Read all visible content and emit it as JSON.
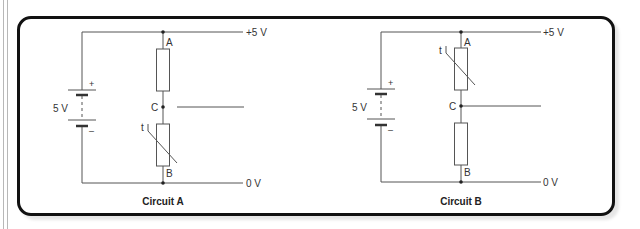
{
  "figure": {
    "colors": {
      "wire": "#555555",
      "frame": "#111111",
      "text": "#333333"
    },
    "circuits": [
      {
        "id": "A",
        "caption": "Circuit A",
        "supply_label": "5 V",
        "battery_plus": "+",
        "battery_minus": "–",
        "rail_top_label": "+5 V",
        "rail_bottom_label": "0 V",
        "node_top": "A",
        "node_mid": "C",
        "node_bottom": "B",
        "thermistor_label": "t",
        "top_component": "resistor",
        "bottom_component": "thermistor"
      },
      {
        "id": "B",
        "caption": "Circuit B",
        "supply_label": "5 V",
        "battery_plus": "+",
        "battery_minus": "–",
        "rail_top_label": "+5 V",
        "rail_bottom_label": "0 V",
        "node_top": "A",
        "node_mid": "C",
        "node_bottom": "B",
        "thermistor_label": "t",
        "top_component": "thermistor",
        "bottom_component": "resistor"
      }
    ]
  }
}
